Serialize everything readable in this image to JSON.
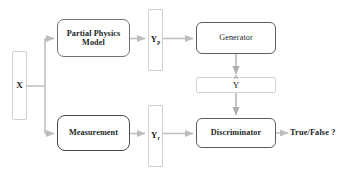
{
  "diagram": {
    "colors": {
      "background": "#ffffff",
      "light_border": "#cfcfcf",
      "medium_border": "#737373",
      "dark_border": "#4a4a4a",
      "edge": "#b4b4b4",
      "edge_dark": "#9a9a9a",
      "text": "#221f1f"
    },
    "nodes": {
      "input_x": {
        "label": "X",
        "shape": "tall-thin-rect"
      },
      "partial_physics_model": {
        "label": "Partial Physics Model",
        "line1": "Partial Physics",
        "line2": "Model",
        "shape": "rounded-rect"
      },
      "measurement": {
        "label": "Measurement",
        "shape": "rounded-rect"
      },
      "y_p": {
        "base": "Y",
        "subscript": "p",
        "shape": "tall-thin-rect"
      },
      "y_r": {
        "base": "Y",
        "subscript": "r",
        "shape": "tall-thin-rect"
      },
      "generator": {
        "label": "Generator",
        "shape": "rounded-rect"
      },
      "y_hat": {
        "base": "Y",
        "accent": "^",
        "shape": "wide-short-rect"
      },
      "discriminator": {
        "label": "Discriminator",
        "shape": "rounded-rect"
      },
      "output": {
        "label": "True/False ?",
        "shape": "text"
      }
    },
    "edges": [
      {
        "from": "input_x",
        "to": "partial_physics_model",
        "style": "branch-up-arrow"
      },
      {
        "from": "input_x",
        "to": "measurement",
        "style": "branch-down-arrow"
      },
      {
        "from": "partial_physics_model",
        "to": "y_p",
        "style": "arrow-right"
      },
      {
        "from": "y_p",
        "to": "generator",
        "style": "arrow-right"
      },
      {
        "from": "generator",
        "to": "y_hat",
        "style": "arrow-down"
      },
      {
        "from": "y_hat",
        "to": "discriminator",
        "style": "arrow-down"
      },
      {
        "from": "measurement",
        "to": "y_r",
        "style": "arrow-right"
      },
      {
        "from": "y_r",
        "to": "discriminator",
        "style": "arrow-right"
      },
      {
        "from": "discriminator",
        "to": "output",
        "style": "arrow-right"
      }
    ]
  }
}
